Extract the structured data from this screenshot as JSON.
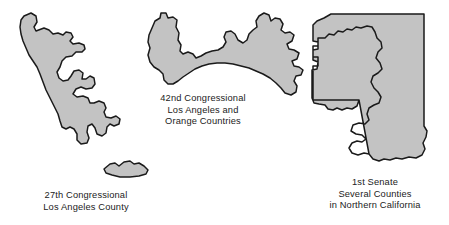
{
  "figure": {
    "name": "legislative-district-outline-maps",
    "background_color": "#ffffff",
    "shape_fill_color": "#c3c3c3",
    "shape_outline_color": "#1a1a1a",
    "text_color": "#1b1b1b"
  },
  "districts": [
    {
      "id": "27th-congressional",
      "caption_lines": [
        "27th Congressional",
        "Los Angeles County"
      ],
      "shape_name": "27th-congressional-district-shape",
      "parts": [
        "mainland-strip",
        "offshore-island"
      ]
    },
    {
      "id": "42nd-congressional",
      "caption_lines": [
        "42nd Congressional",
        "Los Angeles and",
        "Orange Countries"
      ],
      "shape_name": "42nd-congressional-district-shape",
      "parts": [
        "west-lobe",
        "isthmus",
        "east-lobe"
      ]
    },
    {
      "id": "1st-senate",
      "caption_lines": [
        "1st Senate",
        "Several Counties",
        "in Northern California"
      ],
      "shape_name": "1st-senate-district-shape",
      "parts": [
        "outer-boundary",
        "interior-hole"
      ]
    }
  ]
}
